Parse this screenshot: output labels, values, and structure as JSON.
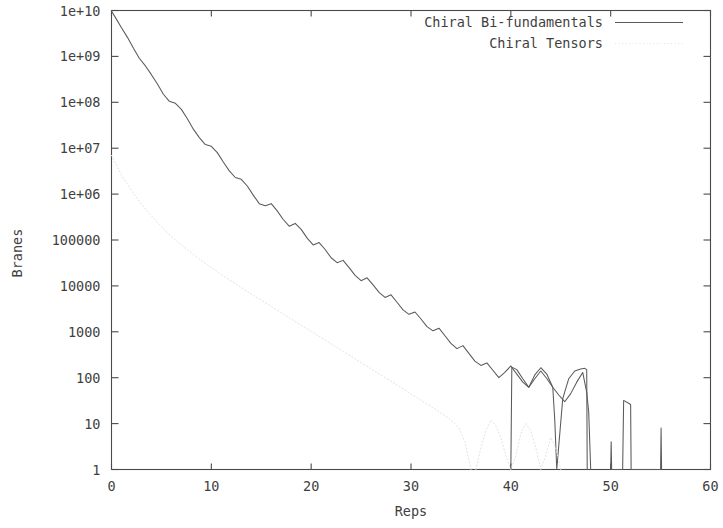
{
  "figure": {
    "background": "#ffffff",
    "frame_color": "#4a4a4a",
    "width": 723,
    "height": 528
  },
  "chart_data": {
    "type": "line",
    "title": "",
    "xlabel": "Reps",
    "ylabel": "Branes",
    "xlim": [
      0,
      60
    ],
    "ylim": [
      1,
      10000000000
    ],
    "yscale": "log",
    "xscale": "linear",
    "grid": false,
    "legend_position": "top-right-inside",
    "xticks": [
      0,
      10,
      20,
      30,
      40,
      50,
      60
    ],
    "xtick_labels": [
      "0",
      "10",
      "20",
      "30",
      "40",
      "50",
      "60"
    ],
    "yticks": [
      1,
      10,
      100,
      1000,
      10000,
      100000,
      1000000,
      10000000,
      100000000,
      1000000000,
      10000000000
    ],
    "ytick_labels": [
      "1",
      "10",
      "100",
      "1000",
      "10000",
      "100000",
      "1e+06",
      "1e+07",
      "1e+08",
      "1e+09",
      "1e+10"
    ],
    "series": [
      {
        "name": "Chiral Bi-fundamentals",
        "style": "solid",
        "color": "#5a5a5a",
        "x": [
          0,
          0.4,
          1,
          1.6,
          2.2,
          2.8,
          3.4,
          4,
          4.6,
          5.2,
          5.8,
          6.4,
          7,
          7.6,
          8.2,
          8.8,
          9.4,
          10,
          10.6,
          11.2,
          11.8,
          12.4,
          13,
          13.6,
          14.2,
          14.8,
          15.4,
          16,
          16.6,
          17.2,
          17.8,
          18.4,
          19,
          19.6,
          20.2,
          20.8,
          21.4,
          22,
          22.6,
          23.2,
          23.8,
          24.4,
          25,
          25.6,
          26.2,
          26.8,
          27.4,
          28,
          28.6,
          29.2,
          29.8,
          30.4,
          31,
          31.6,
          32.2,
          32.8,
          33.4,
          34,
          34.6,
          35.2,
          35.8,
          36.4,
          37,
          37.6,
          38.2,
          38.8,
          39.4,
          40,
          40.6,
          41.2,
          41.8,
          42.4,
          43,
          43.6,
          44.2,
          44.8,
          45.4,
          46,
          46.6,
          47.2,
          47.6,
          47.8,
          48.0
        ],
        "y": [
          9800000000,
          7000000000,
          4200000000,
          2600000000,
          1500000000,
          900000000,
          620000000,
          400000000,
          250000000,
          150000000,
          105000000,
          95000000,
          70000000,
          44000000,
          26000000,
          17000000,
          12000000,
          11000000,
          8000000,
          5000000,
          3200000,
          2300000,
          2100000,
          1500000,
          950000,
          620000,
          560000,
          620000,
          430000,
          280000,
          200000,
          230000,
          170000,
          110000,
          78000,
          88000,
          62000,
          41000,
          32000,
          36000,
          25000,
          17000,
          13000,
          15000,
          10500,
          7200,
          5600,
          6400,
          4400,
          3000,
          2400,
          2700,
          1900,
          1300,
          1050,
          1200,
          820,
          560,
          430,
          500,
          340,
          230,
          185,
          210,
          145,
          100,
          130,
          180,
          120,
          80,
          62,
          95,
          140,
          96,
          62,
          42,
          30,
          45,
          80,
          130,
          48,
          18,
          1
        ]
      },
      {
        "name": "Chiral Bi-fundamentals (tail)",
        "style": "solid",
        "color": "#5a5a5a",
        "x": [
          40.0,
          40.1,
          40.6,
          41.2,
          41.8,
          42.4,
          43.0,
          43.6,
          44.2,
          44.4,
          44.6,
          45.2,
          45.8,
          46.4,
          47.0,
          47.4,
          47.6,
          47.65
        ],
        "y": [
          1,
          170,
          150,
          95,
          62,
          115,
          165,
          120,
          62,
          12,
          1,
          35,
          95,
          140,
          155,
          160,
          150,
          1
        ]
      },
      {
        "name": "Chiral Bi-fundamentals (spikes)",
        "style": "solid",
        "color": "#5a5a5a",
        "x": [
          50.0,
          50.05,
          50.1,
          51.2,
          51.3,
          52.0,
          52.05,
          55.0,
          55.05,
          55.1
        ],
        "y": [
          1,
          4,
          1,
          1,
          32,
          26,
          1,
          1,
          8,
          1
        ]
      },
      {
        "name": "Chiral Tensors",
        "style": "dotted",
        "color": "#e2e2e2",
        "x": [
          0,
          0.6,
          1.2,
          1.8,
          2.4,
          3,
          3.6,
          4.2,
          4.8,
          5.4,
          6,
          6.6,
          7.2,
          7.8,
          8.4,
          9,
          9.6,
          10.2,
          10.8,
          11.4,
          12,
          12.6,
          13.2,
          13.8,
          14.4,
          15,
          15.6,
          16.2,
          16.8,
          17.4,
          18,
          18.6,
          19.2,
          19.8,
          20.4,
          21,
          21.6,
          22.2,
          22.8,
          23.4,
          24,
          24.6,
          25.2,
          25.8,
          26.4,
          27,
          27.6,
          28.2,
          28.8,
          29.4,
          30,
          30.6,
          31.2,
          31.8,
          32.4,
          33,
          33.6,
          34.2,
          34.8,
          35.4,
          36
        ],
        "y": [
          7000000,
          3800000,
          2200000,
          1400000,
          900000,
          600000,
          420000,
          300000,
          215000,
          160000,
          120000,
          92000,
          72000,
          57000,
          45000,
          36000,
          29000,
          23500,
          19000,
          15500,
          12800,
          10500,
          8600,
          7100,
          5900,
          4900,
          4050,
          3350,
          2780,
          2300,
          1910,
          1580,
          1310,
          1090,
          900,
          745,
          620,
          512,
          425,
          352,
          292,
          242,
          200,
          166,
          138,
          114,
          95,
          78,
          65,
          54,
          44,
          37,
          30,
          25,
          21,
          17,
          14,
          11,
          8,
          4,
          1
        ]
      },
      {
        "name": "Chiral Tensors (sparse tail)",
        "style": "dotted",
        "color": "#e2e2e2",
        "x": [
          36.5,
          37,
          37.5,
          38,
          38.5,
          39,
          39.5,
          40,
          40.5,
          41,
          41.5,
          42,
          42.5,
          43,
          43.5,
          44,
          44.5,
          45
        ],
        "y": [
          1,
          3,
          7,
          12,
          9,
          5,
          2,
          1,
          2,
          6,
          10,
          7,
          3,
          1,
          2,
          5,
          3,
          1
        ]
      }
    ]
  },
  "legend": {
    "entries": [
      {
        "label": "Chiral Bi-fundamentals",
        "style": "solid"
      },
      {
        "label": "Chiral Tensors",
        "style": "dotted"
      }
    ]
  },
  "axes": {
    "x_title": "Reps",
    "y_title": "Branes"
  }
}
